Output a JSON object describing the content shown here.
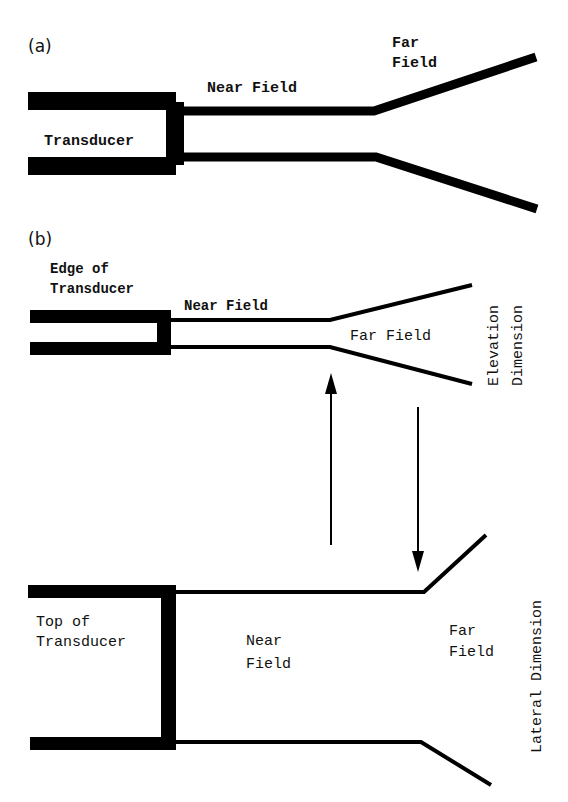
{
  "panel_a": {
    "label": "(a)",
    "transducer_label": "Transducer",
    "near_field_label": "Near Field",
    "far_field_line1": "Far",
    "far_field_line2": "Field"
  },
  "panel_b": {
    "label": "(b)",
    "elevation": {
      "edge_line1": "Edge of",
      "edge_line2": "Transducer",
      "near_field_label": "Near Field",
      "far_field_label": "Far Field",
      "dimension_line1": "Elevation",
      "dimension_line2": "Dimension"
    },
    "lateral": {
      "top_line1": "Top of",
      "top_line2": "Transducer",
      "near_line1": "Near",
      "near_line2": "Field",
      "far_line1": "Far",
      "far_line2": "Field",
      "dimension_label": "Lateral Dimension"
    }
  },
  "colors": {
    "stroke": "#000000",
    "background": "#ffffff"
  }
}
